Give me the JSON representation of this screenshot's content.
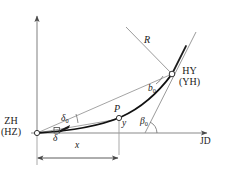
{
  "figure": {
    "type": "geometry-diagram",
    "axes": {
      "horizontal_label": "JD",
      "vertical_label": ""
    },
    "points": {
      "origin": {
        "name_primary": "ZH",
        "name_secondary": "(HZ)"
      },
      "end": {
        "name_primary": "HY",
        "name_secondary": "(YH)"
      },
      "mid": {
        "name_primary": "P"
      }
    },
    "labels": {
      "radius": "R",
      "delta_zero_base": "δ",
      "delta_zero_sub": "0",
      "delta": "δ",
      "b_zero_base": "b",
      "b_zero_sub": "0",
      "beta_zero_base": "β",
      "beta_zero_sub": "0",
      "x": "x",
      "y": "y"
    },
    "colors": {
      "line": "#6e6e6e",
      "curve": "#111111",
      "text": "#1a1a1a",
      "background": "#ffffff"
    }
  }
}
